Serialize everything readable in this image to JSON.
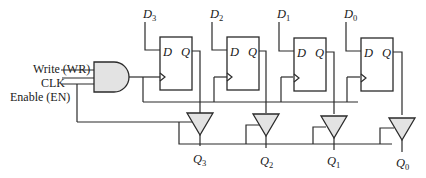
{
  "diagram": {
    "type": "4-bit register with tri-state outputs",
    "inputs": {
      "write": "Write (WR)",
      "clk": "CLK",
      "enable": "Enable (EN)"
    },
    "data_inputs": [
      {
        "name": "D",
        "sub": "3"
      },
      {
        "name": "D",
        "sub": "2"
      },
      {
        "name": "D",
        "sub": "1"
      },
      {
        "name": "D",
        "sub": "0"
      }
    ],
    "flipflops": [
      {
        "d_label": "D",
        "q_label": "Q"
      },
      {
        "d_label": "D",
        "q_label": "Q"
      },
      {
        "d_label": "D",
        "q_label": "Q"
      },
      {
        "d_label": "D",
        "q_label": "Q"
      }
    ],
    "outputs": [
      {
        "name": "Q",
        "sub": "3"
      },
      {
        "name": "Q",
        "sub": "2"
      },
      {
        "name": "Q",
        "sub": "1"
      },
      {
        "name": "Q",
        "sub": "0"
      }
    ],
    "colors": {
      "line": "#2a2a2a",
      "gate_fill": "#e3e3e3"
    }
  }
}
